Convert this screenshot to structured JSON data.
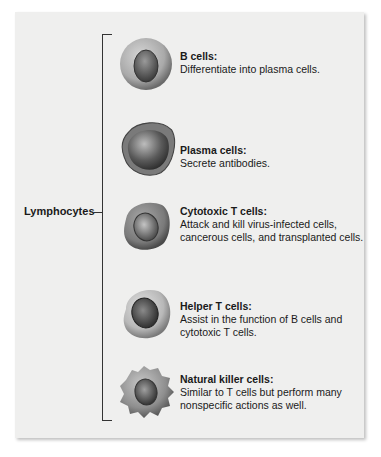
{
  "group": {
    "label": "Lymphocytes"
  },
  "cells": [
    {
      "title": "B cells:",
      "description": "Differentiate into plasma cells.",
      "icon": "b-cell-icon",
      "top": 36,
      "text_top": 14
    },
    {
      "title": "Plasma cells:",
      "description": "Secrete antibodies.",
      "icon": "plasma-cell-icon",
      "top": 115,
      "text_top": 29
    },
    {
      "title": "Cytotoxic T cells:",
      "description": "Attack and kill virus-infected cells, cancerous cells, and transplanted cells.",
      "icon": "cytotoxic-t-cell-icon",
      "top": 197,
      "text_top": 8
    },
    {
      "title": "Helper T cells:",
      "description": "Assist in the function of B cells and cytotoxic T cells.",
      "icon": "helper-t-cell-icon",
      "top": 285,
      "text_top": 15
    },
    {
      "title": "Natural killer cells:",
      "description": "Similar to T cells but perform many nonspecific actions as well.",
      "icon": "natural-killer-cell-icon",
      "top": 364,
      "text_top": 9
    }
  ]
}
